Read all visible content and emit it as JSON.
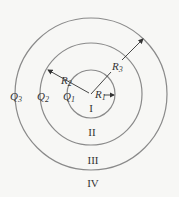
{
  "diagram": {
    "type": "concentric-spherical-shells",
    "center": [
      91,
      94
    ],
    "circles": [
      {
        "name": "inner",
        "radius": 24,
        "charge": "Q",
        "charge_sub": "1",
        "radius_label": "R",
        "radius_sub": "1"
      },
      {
        "name": "middle",
        "radius": 51,
        "charge": "Q",
        "charge_sub": "2",
        "radius_label": "R",
        "radius_sub": "2"
      },
      {
        "name": "outer",
        "radius": 76,
        "charge": "Q",
        "charge_sub": "3",
        "radius_label": "R",
        "radius_sub": "3"
      }
    ],
    "regions": [
      "I",
      "II",
      "III",
      "IV"
    ],
    "stroke_color": "#8a8a8a",
    "arrow_color": "#333333",
    "background": "#f7f7f5"
  }
}
